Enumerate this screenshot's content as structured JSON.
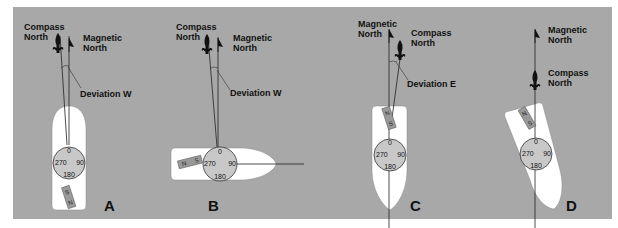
{
  "diagram": {
    "colors": {
      "background": "#a8a8a8",
      "hull": "#ffffff",
      "compass_card": "#c8c8c8",
      "ink": "#111111"
    },
    "panels": [
      {
        "id": "A",
        "label": "A",
        "labels": {
          "compass_north_1": "Compass",
          "compass_north_2": "North",
          "magnetic_north_1": "Magnetic",
          "magnetic_north_2": "North",
          "deviation": "Deviation W"
        },
        "compass": {
          "n": "0",
          "e": "90",
          "s": "180",
          "w": "270"
        },
        "magnet": {
          "a": "S",
          "b": "N"
        }
      },
      {
        "id": "B",
        "label": "B",
        "labels": {
          "compass_north_1": "Compass",
          "compass_north_2": "North",
          "magnetic_north_1": "Magnetic",
          "magnetic_north_2": "North",
          "deviation": "Deviation W"
        },
        "compass": {
          "n": "0",
          "e": "90",
          "s": "180",
          "w": "270"
        },
        "magnet": {
          "a": "N",
          "b": "S"
        }
      },
      {
        "id": "C",
        "label": "C",
        "labels": {
          "compass_north_1": "Compass",
          "compass_north_2": "North",
          "magnetic_north_1": "Magnetic",
          "magnetic_north_2": "North",
          "deviation": "Deviation E"
        },
        "compass": {
          "n": "0",
          "e": "90",
          "s": "180",
          "w": "270"
        },
        "magnet": {
          "a": "N",
          "b": "S"
        }
      },
      {
        "id": "D",
        "label": "D",
        "labels": {
          "compass_north_1": "Compass",
          "compass_north_2": "North",
          "magnetic_north_1": "Magnetic",
          "magnetic_north_2": "North"
        },
        "compass": {
          "n": "0",
          "e": "90",
          "s": "180",
          "w": "270"
        },
        "magnet": {
          "a": "N",
          "b": "S"
        }
      }
    ]
  }
}
